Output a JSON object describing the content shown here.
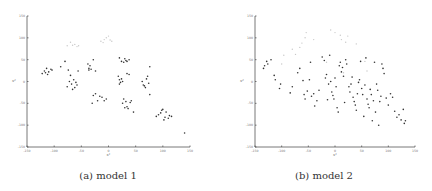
{
  "chart_data": [
    {
      "type": "scatter",
      "title": "",
      "caption": "(a) model 1",
      "xlabel": "x¹",
      "ylabel": "x²",
      "xlim": [
        -150,
        150
      ],
      "ylim": [
        -150,
        150
      ],
      "xticks": [
        "-150",
        "-100",
        "-50",
        "0",
        "50",
        "100",
        "150"
      ],
      "yticks": [
        "150",
        "100",
        "50",
        "0",
        "-50",
        "-100",
        "-150"
      ],
      "grid": false,
      "legend": null,
      "series": [
        {
          "name": "faint points",
          "color": "#c8c8c8",
          "points": [
            [
              -76,
              82
            ],
            [
              -70,
              90
            ],
            [
              -66,
              83
            ],
            [
              -62,
              85
            ],
            [
              -58,
              80
            ],
            [
              -55,
              82
            ],
            [
              -14,
              92
            ],
            [
              -8,
              96
            ],
            [
              -4,
              100
            ],
            [
              0,
              104
            ],
            [
              3,
              95
            ],
            [
              6,
              92
            ],
            [
              -10,
              89
            ]
          ]
        },
        {
          "name": "dark points",
          "color": "#333333",
          "points": [
            [
              -122,
              18
            ],
            [
              -118,
              24
            ],
            [
              -114,
              30
            ],
            [
              -110,
              22
            ],
            [
              -106,
              28
            ],
            [
              -112,
              16
            ],
            [
              -116,
              20
            ],
            [
              -104,
              26
            ],
            [
              -88,
              34
            ],
            [
              -80,
              46
            ],
            [
              -74,
              26
            ],
            [
              -70,
              14
            ],
            [
              -72,
              0
            ],
            [
              -76,
              -12
            ],
            [
              -68,
              -6
            ],
            [
              -64,
              4
            ],
            [
              -60,
              -2
            ],
            [
              -66,
              -18
            ],
            [
              -62,
              -14
            ],
            [
              -58,
              -8
            ],
            [
              -56,
              24
            ],
            [
              -38,
              40
            ],
            [
              -36,
              30
            ],
            [
              -34,
              36
            ],
            [
              -32,
              28
            ],
            [
              -28,
              50
            ],
            [
              -24,
              24
            ],
            [
              -36,
              26
            ],
            [
              -28,
              -32
            ],
            [
              -24,
              -28
            ],
            [
              -20,
              -44
            ],
            [
              -16,
              -34
            ],
            [
              -12,
              -36
            ],
            [
              -8,
              -44
            ],
            [
              -4,
              -40
            ],
            [
              -30,
              -50
            ],
            [
              20,
              54
            ],
            [
              24,
              46
            ],
            [
              30,
              52
            ],
            [
              34,
              46
            ],
            [
              38,
              50
            ],
            [
              32,
              48
            ],
            [
              28,
              44
            ],
            [
              18,
              12
            ],
            [
              20,
              4
            ],
            [
              22,
              -2
            ],
            [
              24,
              6
            ],
            [
              26,
              0
            ],
            [
              20,
              -6
            ],
            [
              34,
              18
            ],
            [
              38,
              16
            ],
            [
              28,
              -40
            ],
            [
              32,
              -46
            ],
            [
              30,
              -60
            ],
            [
              34,
              -58
            ],
            [
              36,
              -62
            ],
            [
              40,
              -48
            ],
            [
              42,
              -44
            ],
            [
              46,
              -70
            ],
            [
              26,
              -50
            ],
            [
              62,
              0
            ],
            [
              64,
              -8
            ],
            [
              66,
              -10
            ],
            [
              68,
              -14
            ],
            [
              70,
              6
            ],
            [
              72,
              12
            ],
            [
              74,
              -4
            ],
            [
              76,
              34
            ],
            [
              76,
              -30
            ],
            [
              88,
              -80
            ],
            [
              92,
              -76
            ],
            [
              96,
              -72
            ],
            [
              98,
              -66
            ],
            [
              100,
              -64
            ],
            [
              104,
              -82
            ],
            [
              106,
              -70
            ],
            [
              110,
              -84
            ],
            [
              112,
              -78
            ],
            [
              116,
              -80
            ],
            [
              102,
              -88
            ],
            [
              140,
              -118
            ]
          ]
        }
      ]
    },
    {
      "type": "scatter",
      "title": "",
      "caption": "(b) model 2",
      "xlabel": "x¹",
      "ylabel": "x²",
      "xlim": [
        -150,
        150
      ],
      "ylim": [
        -150,
        150
      ],
      "xticks": [
        "-150",
        "-100",
        "-50",
        "0",
        "50",
        "100",
        "150"
      ],
      "yticks": [
        "150",
        "100",
        "50",
        "0",
        "-50",
        "-100",
        "-150"
      ],
      "grid": false,
      "legend": null,
      "series": [
        {
          "name": "faint points",
          "color": "#c8c8c8",
          "points": [
            [
              -96,
              60
            ],
            [
              -74,
              62
            ],
            [
              -66,
              78
            ],
            [
              -62,
              88
            ],
            [
              -56,
              100
            ],
            [
              -54,
              112
            ],
            [
              -40,
              96
            ],
            [
              -8,
              118
            ],
            [
              0,
              112
            ],
            [
              10,
              106
            ],
            [
              12,
              96
            ],
            [
              20,
              90
            ],
            [
              24,
              104
            ],
            [
              40,
              86
            ],
            [
              -80,
              74
            ],
            [
              -16,
              44
            ],
            [
              56,
              46
            ],
            [
              16,
              20
            ],
            [
              60,
              24
            ],
            [
              -100,
              40
            ]
          ]
        },
        {
          "name": "dark points",
          "color": "#333333",
          "points": [
            [
              -134,
              30
            ],
            [
              -132,
              36
            ],
            [
              -128,
              46
            ],
            [
              -126,
              40
            ],
            [
              -120,
              50
            ],
            [
              -112,
              4
            ],
            [
              -114,
              14
            ],
            [
              -104,
              -16
            ],
            [
              -102,
              -6
            ],
            [
              -84,
              -26
            ],
            [
              -80,
              -12
            ],
            [
              -70,
              20
            ],
            [
              -66,
              30
            ],
            [
              -60,
              2
            ],
            [
              -58,
              -30
            ],
            [
              -56,
              -40
            ],
            [
              -52,
              -22
            ],
            [
              -48,
              4
            ],
            [
              -46,
              44
            ],
            [
              -44,
              -34
            ],
            [
              -40,
              -28
            ],
            [
              -38,
              -56
            ],
            [
              -34,
              -44
            ],
            [
              -30,
              -20
            ],
            [
              -24,
              56
            ],
            [
              -20,
              48
            ],
            [
              -18,
              8
            ],
            [
              -16,
              16
            ],
            [
              -14,
              -42
            ],
            [
              -12,
              -6
            ],
            [
              -10,
              60
            ],
            [
              -8,
              0
            ],
            [
              -6,
              -24
            ],
            [
              -4,
              -32
            ],
            [
              -2,
              -40
            ],
            [
              0,
              8
            ],
            [
              2,
              -12
            ],
            [
              4,
              -60
            ],
            [
              6,
              -70
            ],
            [
              8,
              36
            ],
            [
              10,
              44
            ],
            [
              12,
              22
            ],
            [
              14,
              32
            ],
            [
              16,
              12
            ],
            [
              18,
              -48
            ],
            [
              20,
              50
            ],
            [
              22,
              40
            ],
            [
              26,
              -12
            ],
            [
              28,
              -24
            ],
            [
              30,
              -6
            ],
            [
              32,
              10
            ],
            [
              34,
              -36
            ],
            [
              36,
              -46
            ],
            [
              38,
              -54
            ],
            [
              40,
              -66
            ],
            [
              42,
              -28
            ],
            [
              44,
              -2
            ],
            [
              46,
              4
            ],
            [
              48,
              46
            ],
            [
              50,
              -16
            ],
            [
              52,
              -30
            ],
            [
              54,
              -80
            ],
            [
              56,
              -8
            ],
            [
              58,
              54
            ],
            [
              60,
              -40
            ],
            [
              62,
              -52
            ],
            [
              64,
              -60
            ],
            [
              66,
              -18
            ],
            [
              68,
              -30
            ],
            [
              70,
              -90
            ],
            [
              72,
              -44
            ],
            [
              74,
              44
            ],
            [
              76,
              -70
            ],
            [
              78,
              -6
            ],
            [
              80,
              -20
            ],
            [
              82,
              -100
            ],
            [
              84,
              -46
            ],
            [
              86,
              -34
            ],
            [
              88,
              40
            ],
            [
              90,
              30
            ],
            [
              92,
              18
            ],
            [
              96,
              -38
            ],
            [
              100,
              -54
            ],
            [
              104,
              -28
            ],
            [
              108,
              -36
            ],
            [
              112,
              -68
            ],
            [
              116,
              -82
            ],
            [
              120,
              -76
            ],
            [
              124,
              -88
            ],
            [
              128,
              -64
            ],
            [
              130,
              -96
            ],
            [
              132,
              -90
            ]
          ]
        }
      ]
    }
  ]
}
